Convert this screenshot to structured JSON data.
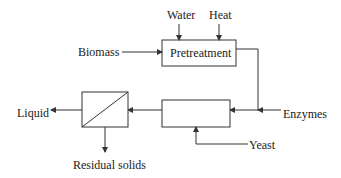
{
  "diagram": {
    "colors": {
      "stroke": "#333333",
      "box_fill": "#ffffff",
      "text": "#222222"
    },
    "labels": {
      "water": "Water",
      "heat": "Heat",
      "biomass": "Biomass",
      "pretreatment": "Pretreatment",
      "enzymes": "Enzymes",
      "yeast": "Yeast",
      "liquid": "Liquid",
      "residual_solids": "Residual solids"
    },
    "nodes": [
      {
        "id": "pretreatment",
        "label": "Pretreatment"
      },
      {
        "id": "reactor",
        "label": ""
      },
      {
        "id": "separator",
        "label": ""
      }
    ],
    "edges": [
      {
        "from": "Water",
        "to": "pretreatment"
      },
      {
        "from": "Heat",
        "to": "pretreatment"
      },
      {
        "from": "Biomass",
        "to": "pretreatment"
      },
      {
        "from": "pretreatment",
        "to": "reactor"
      },
      {
        "from": "Enzymes",
        "to": "reactor"
      },
      {
        "from": "Yeast",
        "to": "reactor"
      },
      {
        "from": "reactor",
        "to": "separator"
      },
      {
        "from": "separator",
        "to": "Liquid"
      },
      {
        "from": "separator",
        "to": "Residual solids"
      }
    ]
  }
}
